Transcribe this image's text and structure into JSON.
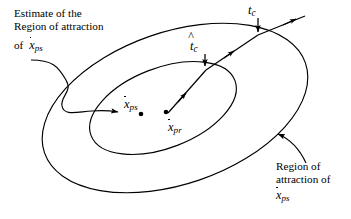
{
  "figure": {
    "background_color": "#ffffff",
    "stroke_color": "#000000",
    "width": 351,
    "height": 219
  },
  "annotations": {
    "estimate_line1": "Estimate of the",
    "estimate_line2": "Region of attraction",
    "of_word": "of",
    "of_symbol_base": "x",
    "of_symbol_sub": "ps",
    "region_line1": "Region of",
    "region_line2": "attraction of",
    "region_symbol_base": "x",
    "region_symbol_sub": "ps"
  },
  "time_labels": {
    "tc_base": "t",
    "tc_sub": "c",
    "tchat_base": "t",
    "tchat_sub": "c"
  },
  "equilibria": [
    {
      "name": "x-ps",
      "base": "x",
      "sub": "ps",
      "point_x": 141,
      "point_y": 114
    },
    {
      "name": "x-pr",
      "base": "x",
      "sub": "pr",
      "point_x": 166,
      "point_y": 112
    }
  ],
  "shapes": {
    "outer_ellipse": {
      "cx": 175,
      "cy": 108,
      "rx": 138,
      "ry": 76,
      "rotation_deg": -19
    },
    "inner_ellipse": {
      "cx": 163,
      "cy": 108,
      "rx": 77,
      "ry": 40,
      "rotation_deg": -21
    }
  },
  "colors": {
    "ink": "#000000",
    "paper": "#ffffff"
  }
}
